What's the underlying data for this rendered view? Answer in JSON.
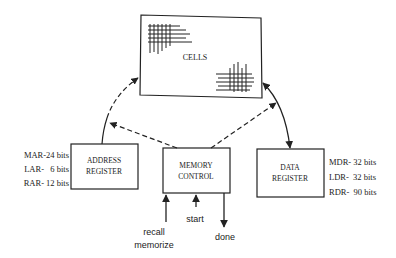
{
  "diagram": {
    "cells": {
      "label": "CELLS"
    },
    "address_register": {
      "line1": "ADDRESS",
      "line2": "REGISTER",
      "fields": [
        {
          "name": "MAR-24 bits"
        },
        {
          "name": "LAR-   6 bits"
        },
        {
          "name": "RAR- 12 bits"
        }
      ]
    },
    "memory_control": {
      "line1": "MEMORY",
      "line2": "CONTROL",
      "signals": {
        "recall": "recall",
        "memorize": "memorize",
        "start": "start",
        "done": "done"
      }
    },
    "data_register": {
      "line1": "DATA",
      "line2": "REGISTER",
      "fields": [
        {
          "name": "MDR- 32 bits"
        },
        {
          "name": "LDR-  32 bits"
        },
        {
          "name": "RDR-  90 bits"
        }
      ]
    },
    "colors": {
      "stroke": "#222222",
      "background": "#ffffff"
    }
  }
}
